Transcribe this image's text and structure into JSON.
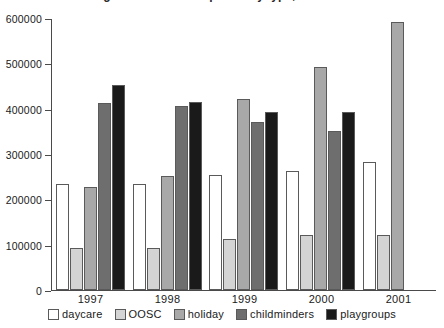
{
  "chart_data": {
    "type": "bar",
    "title": "Registered childcare places by type, 1997-2001",
    "xlabel": "",
    "ylabel": "",
    "categories": [
      "1997",
      "1998",
      "1999",
      "2000",
      "2001"
    ],
    "series": [
      {
        "name": "daycare",
        "color": "#ffffff",
        "values": [
          233000,
          233000,
          253000,
          262000,
          283000
        ]
      },
      {
        "name": "OOSC",
        "color": "#d4d4d4",
        "values": [
          92000,
          92000,
          112000,
          122000,
          122000
        ]
      },
      {
        "name": "holiday",
        "color": "#a8a8a8",
        "values": [
          228000,
          251000,
          421000,
          491000,
          592000
        ]
      },
      {
        "name": "childminders",
        "color": "#6e6e6e",
        "values": [
          412000,
          405000,
          370000,
          350000,
          null
        ]
      },
      {
        "name": "playgroups",
        "color": "#1a1a1a",
        "values": [
          452000,
          415000,
          392000,
          392000,
          null
        ]
      }
    ],
    "ylim": [
      0,
      600000
    ],
    "yticks": [
      0,
      100000,
      200000,
      300000,
      400000,
      500000,
      600000
    ],
    "ytick_labels": [
      "0",
      "100000",
      "200000",
      "300000",
      "400000",
      "500000",
      "600000"
    ],
    "grid": false,
    "legend_position": "bottom"
  },
  "axis": {
    "bar_border_color": "#5a5a5a",
    "axis_color": "#4a4a4a"
  }
}
